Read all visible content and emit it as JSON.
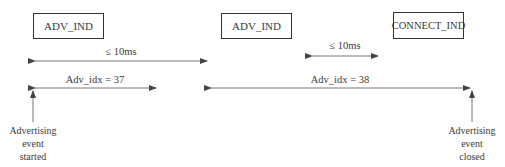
{
  "diagram": {
    "type": "timing-diagram",
    "packets": [
      {
        "id": "p1",
        "label": "ADV_IND"
      },
      {
        "id": "p2",
        "label": "ADV_IND"
      },
      {
        "id": "p3",
        "label": "CONNECT_IND"
      }
    ],
    "intervals": [
      {
        "id": "i1",
        "label": "≤ 10ms",
        "from": "p1",
        "to": "p2"
      },
      {
        "id": "i2",
        "label": "≤ 10ms",
        "from": "p2",
        "to": "p3"
      }
    ],
    "events": [
      {
        "id": "e1",
        "label": "Adv_idx = 37"
      },
      {
        "id": "e2",
        "label": "Adv_idx = 38"
      }
    ],
    "markers": [
      {
        "id": "m1",
        "lines": [
          "Advertising",
          "event",
          "started"
        ]
      },
      {
        "id": "m2",
        "lines": [
          "Advertising",
          "event",
          "closed"
        ]
      }
    ],
    "colors": {
      "line": "#444444",
      "text": "#3a3a3a"
    }
  }
}
